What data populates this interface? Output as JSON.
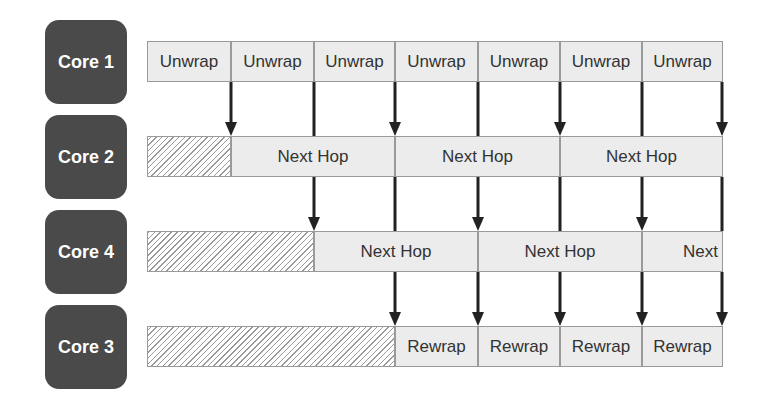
{
  "cores": [
    {
      "label": "Core 1",
      "top": 20
    },
    {
      "label": "Core 2",
      "top": 115
    },
    {
      "label": "Core 4",
      "top": 210
    },
    {
      "label": "Core 3",
      "top": 305
    }
  ],
  "rows": [
    {
      "core": "Core 1",
      "top": 41,
      "hatch_width": 0,
      "cells": [
        {
          "label": "Unwrap",
          "x": 147,
          "w": 84
        },
        {
          "label": "Unwrap",
          "x": 231,
          "w": 83
        },
        {
          "label": "Unwrap",
          "x": 314,
          "w": 81
        },
        {
          "label": "Unwrap",
          "x": 395,
          "w": 83
        },
        {
          "label": "Unwrap",
          "x": 478,
          "w": 82
        },
        {
          "label": "Unwrap",
          "x": 560,
          "w": 82
        },
        {
          "label": "Unwrap",
          "x": 642,
          "w": 81
        }
      ]
    },
    {
      "core": "Core 2",
      "top": 136,
      "hatch_width": 84,
      "cells": [
        {
          "label": "Next Hop",
          "x": 231,
          "w": 164
        },
        {
          "label": "Next Hop",
          "x": 395,
          "w": 165
        },
        {
          "label": "Next Hop",
          "x": 560,
          "w": 163
        }
      ]
    },
    {
      "core": "Core 4",
      "top": 231,
      "hatch_width": 167,
      "cells": [
        {
          "label": "Next Hop",
          "x": 314,
          "w": 164
        },
        {
          "label": "Next Hop",
          "x": 478,
          "w": 164
        },
        {
          "label": "Next",
          "x": 642,
          "w": 81,
          "align": "right"
        }
      ]
    },
    {
      "core": "Core 3",
      "top": 326,
      "hatch_width": 248,
      "cells": [
        {
          "label": "Rewrap",
          "x": 395,
          "w": 83
        },
        {
          "label": "Rewrap",
          "x": 478,
          "w": 82
        },
        {
          "label": "Rewrap",
          "x": 560,
          "w": 82
        },
        {
          "label": "Rewrap",
          "x": 642,
          "w": 81
        }
      ]
    }
  ],
  "arrows": [
    {
      "x": 231,
      "y1": 82,
      "y2": 136,
      "head": true
    },
    {
      "x": 314,
      "y1": 82,
      "y2": 136,
      "head": false
    },
    {
      "x": 395,
      "y1": 82,
      "y2": 136,
      "head": true
    },
    {
      "x": 478,
      "y1": 82,
      "y2": 136,
      "head": false
    },
    {
      "x": 560,
      "y1": 82,
      "y2": 136,
      "head": true
    },
    {
      "x": 642,
      "y1": 82,
      "y2": 136,
      "head": false
    },
    {
      "x": 722,
      "y1": 82,
      "y2": 136,
      "head": true
    },
    {
      "x": 314,
      "y1": 177,
      "y2": 231,
      "head": true
    },
    {
      "x": 395,
      "y1": 177,
      "y2": 231,
      "head": false
    },
    {
      "x": 478,
      "y1": 177,
      "y2": 231,
      "head": true
    },
    {
      "x": 560,
      "y1": 177,
      "y2": 231,
      "head": false
    },
    {
      "x": 642,
      "y1": 177,
      "y2": 231,
      "head": true
    },
    {
      "x": 722,
      "y1": 177,
      "y2": 231,
      "head": false
    },
    {
      "x": 395,
      "y1": 272,
      "y2": 326,
      "head": true
    },
    {
      "x": 478,
      "y1": 272,
      "y2": 326,
      "head": true
    },
    {
      "x": 560,
      "y1": 272,
      "y2": 326,
      "head": true
    },
    {
      "x": 642,
      "y1": 272,
      "y2": 326,
      "head": true
    },
    {
      "x": 722,
      "y1": 272,
      "y2": 326,
      "head": true
    }
  ]
}
